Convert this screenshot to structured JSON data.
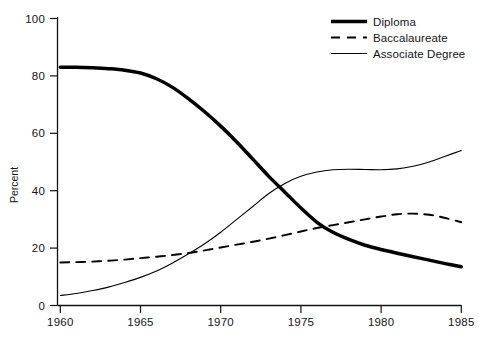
{
  "chart_data": {
    "type": "line",
    "title": "",
    "xlabel": "",
    "ylabel": "Percent",
    "xlim": [
      1960,
      1985
    ],
    "ylim": [
      0,
      100
    ],
    "grid": false,
    "legend_position": "top-right",
    "x_ticks": [
      "1960",
      "1965",
      "1970",
      "1975",
      "1980",
      "1985"
    ],
    "y_ticks": [
      "0",
      "20",
      "40",
      "60",
      "80",
      "100"
    ],
    "x": [
      1960,
      1961,
      1962,
      1963,
      1964,
      1965,
      1966,
      1967,
      1968,
      1969,
      1970,
      1971,
      1972,
      1973,
      1974,
      1975,
      1976,
      1977,
      1978,
      1979,
      1980,
      1981,
      1982,
      1983,
      1984,
      1985
    ],
    "series": [
      {
        "name": "Diploma",
        "style": "thick-solid",
        "color": "#000000",
        "values": [
          83,
          83,
          82.8,
          82.5,
          82,
          81,
          79,
          76,
          72,
          67.5,
          62.5,
          57,
          51,
          45,
          39.5,
          34,
          29,
          25.5,
          23,
          21,
          19.5,
          18.2,
          17,
          15.8,
          14.6,
          13.5
        ]
      },
      {
        "name": "Baccalaureate",
        "style": "dashed",
        "color": "#000000",
        "values": [
          15,
          15.1,
          15.3,
          15.6,
          16,
          16.5,
          17,
          17.6,
          18.3,
          19.2,
          20.2,
          21.2,
          22.2,
          23.3,
          24.5,
          25.8,
          27,
          28,
          29,
          30,
          31,
          31.8,
          32,
          31.6,
          30.5,
          29
        ]
      },
      {
        "name": "Associate Degree",
        "style": "thin-solid",
        "color": "#000000",
        "values": [
          3.5,
          4.2,
          5.2,
          6.4,
          8,
          9.8,
          12,
          14.8,
          18,
          21.5,
          25.5,
          30,
          34.5,
          39,
          42.5,
          45,
          46.5,
          47.3,
          47.5,
          47.4,
          47.3,
          47.6,
          48.5,
          50,
          52,
          54
        ]
      }
    ]
  },
  "legend": {
    "items": [
      {
        "label": "Diploma",
        "swatch": "thick-solid-line-swatch"
      },
      {
        "label": "Baccalaureate",
        "swatch": "dashed-line-swatch"
      },
      {
        "label": "Associate Degree",
        "swatch": "thin-solid-line-swatch"
      }
    ]
  },
  "axes": {
    "y_axis_title": "Percent"
  }
}
